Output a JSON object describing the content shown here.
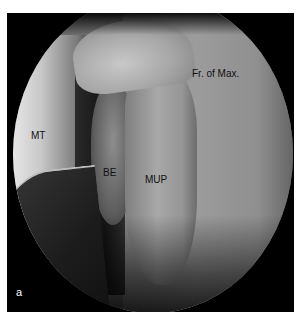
{
  "figure": {
    "panel_label": "a",
    "annotations": {
      "frontal_process": "Fr. of Max.",
      "middle_turbinate": "MT",
      "bulla_ethmoidalis": "BE",
      "uncinate_process": "MUP"
    },
    "colors": {
      "background": "#ffffff",
      "frame": "#000000",
      "label_text": "#111111",
      "panel_label_text": "#ffffff"
    }
  }
}
